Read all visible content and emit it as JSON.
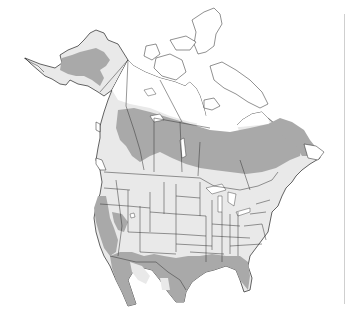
{
  "map": {
    "title": "",
    "region": "North America",
    "legend": [
      {
        "key": "range-primary",
        "description": "dark gray shaded range",
        "color": "#a9a9a9"
      },
      {
        "key": "range-secondary",
        "description": "light gray land",
        "color": "#e9e9e9"
      },
      {
        "key": "outside-range",
        "description": "white (arctic / tundra)",
        "color": "#ffffff"
      }
    ],
    "colors": {
      "land": "#e9e9e9",
      "range": "#a9a9a9",
      "tundra": "#ffffff",
      "outline": "#222222",
      "background": "#ffffff"
    }
  }
}
